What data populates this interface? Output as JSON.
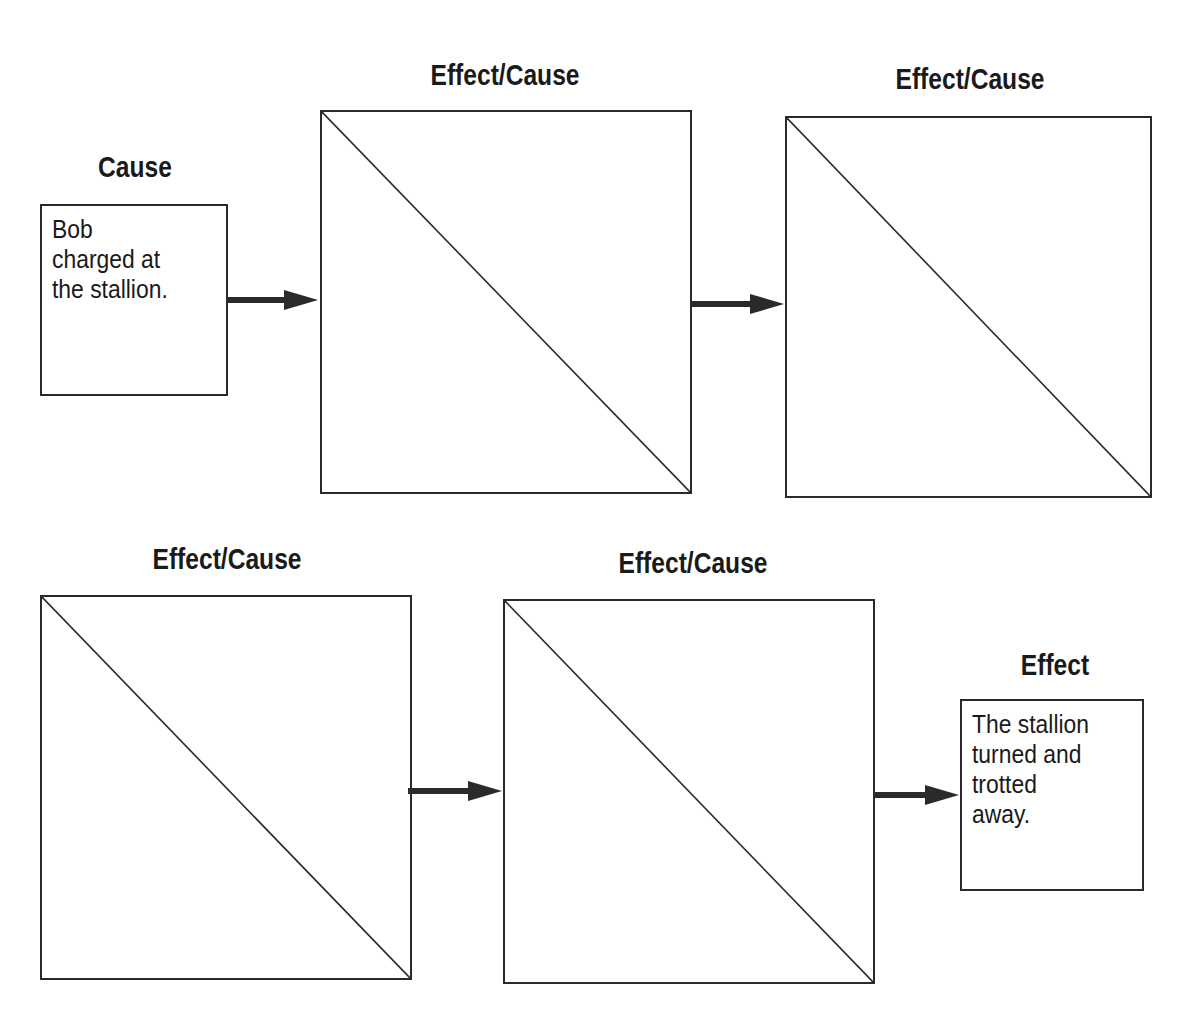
{
  "diagram": {
    "cause": {
      "heading": "Cause",
      "text": "Bob\ncharged at\nthe stallion."
    },
    "effect_cause_boxes": [
      {
        "heading": "Effect/Cause",
        "effect_text": "",
        "cause_text": ""
      },
      {
        "heading": "Effect/Cause",
        "effect_text": "",
        "cause_text": ""
      },
      {
        "heading": "Effect/Cause",
        "effect_text": "",
        "cause_text": ""
      },
      {
        "heading": "Effect/Cause",
        "effect_text": "",
        "cause_text": ""
      }
    ],
    "effect": {
      "heading": "Effect",
      "text": "The stallion\nturned and\ntrotted\naway."
    },
    "colors": {
      "line": "#2a2a2a",
      "background": "#ffffff"
    }
  }
}
